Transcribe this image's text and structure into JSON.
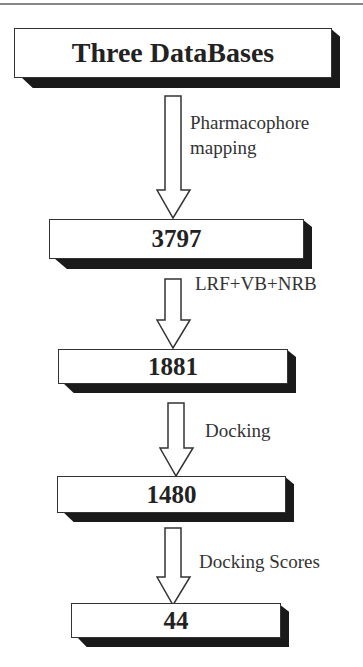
{
  "diagram": {
    "type": "flowchart",
    "direction": "top-to-bottom",
    "nodes": [
      {
        "id": "n1",
        "label": "Three DataBases"
      },
      {
        "id": "n2",
        "label": "3797"
      },
      {
        "id": "n3",
        "label": "1881"
      },
      {
        "id": "n4",
        "label": "1480"
      },
      {
        "id": "n5",
        "label": "44"
      }
    ],
    "edges": [
      {
        "from": "n1",
        "to": "n2",
        "label_line1": "Pharmacophore",
        "label_line2": "mapping"
      },
      {
        "from": "n2",
        "to": "n3",
        "label": "LRF+VB+NRB"
      },
      {
        "from": "n3",
        "to": "n4",
        "label": "Docking"
      },
      {
        "from": "n4",
        "to": "n5",
        "label": "Docking Scores"
      }
    ]
  }
}
